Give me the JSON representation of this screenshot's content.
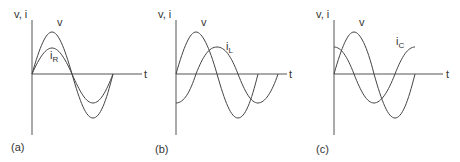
{
  "figure": {
    "panels": [
      {
        "id": "a",
        "caption": "(a)",
        "y_axis_label": "v, i",
        "x_axis_label": "t",
        "curves": [
          {
            "name": "v",
            "label": "v",
            "subscript": "",
            "relation": "reference"
          },
          {
            "name": "i_R",
            "label": "i",
            "subscript": "R",
            "relation": "in phase with v, smaller amplitude"
          }
        ]
      },
      {
        "id": "b",
        "caption": "(b)",
        "y_axis_label": "v, i",
        "x_axis_label": "t",
        "curves": [
          {
            "name": "v",
            "label": "v",
            "subscript": "",
            "relation": "reference"
          },
          {
            "name": "i_L",
            "label": "i",
            "subscript": "L",
            "relation": "lags v by 90°"
          }
        ]
      },
      {
        "id": "c",
        "caption": "(c)",
        "y_axis_label": "v, i",
        "x_axis_label": "t",
        "curves": [
          {
            "name": "v",
            "label": "v",
            "subscript": "",
            "relation": "reference"
          },
          {
            "name": "i_C",
            "label": "i",
            "subscript": "C",
            "relation": "leads v by 90°"
          }
        ]
      }
    ],
    "colors": {
      "line": "#444444",
      "axis": "#555555",
      "text": "#333333",
      "background": "#ffffff"
    }
  }
}
